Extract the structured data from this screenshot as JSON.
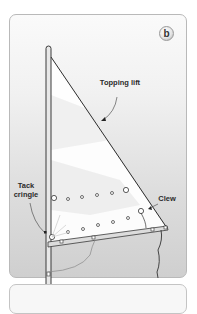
{
  "panel": {
    "badge": "b"
  },
  "labels": {
    "topping_lift": "Topping lift",
    "tack_cringle_line1": "Tack",
    "tack_cringle_line2": "cringle",
    "clew": "Clew"
  },
  "colors": {
    "line": "#2e2e2e",
    "sail": "#ffffff",
    "panel_border": "#b9b9b9"
  }
}
